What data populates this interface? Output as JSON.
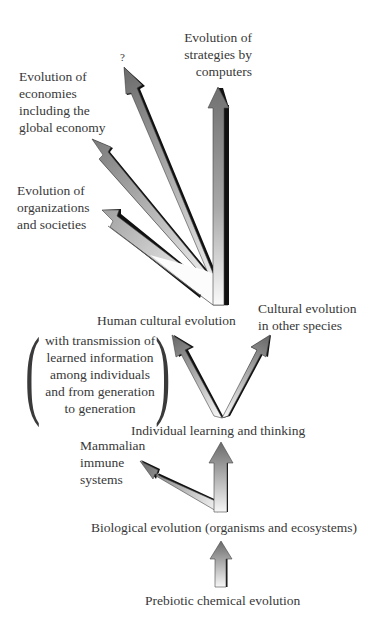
{
  "diagram": {
    "title": "",
    "nodes": {
      "computers": {
        "lines": [
          "Evolution of",
          "strategies by",
          "computers"
        ]
      },
      "unknown": {
        "lines": [
          "?"
        ]
      },
      "economies": {
        "lines": [
          "Evolution of",
          "economies",
          "including the",
          "global economy"
        ]
      },
      "organizations": {
        "lines": [
          "Evolution of",
          "organizations",
          "and societies"
        ]
      },
      "human_cultural": {
        "lines": [
          "Human cultural evolution"
        ]
      },
      "cultural_other": {
        "lines": [
          "Cultural evolution",
          "in other species"
        ]
      },
      "transmission_note": {
        "lines": [
          "with transmission of",
          "learned information",
          "among individuals",
          "and from generation",
          "to generation"
        ],
        "paren_open": "(",
        "paren_close": ")"
      },
      "individual_learning": {
        "lines": [
          "Individual learning and thinking"
        ]
      },
      "immune": {
        "lines": [
          "Mammalian",
          "immune",
          "systems"
        ]
      },
      "biological": {
        "lines": [
          "Biological evolution (organisms and ecosystems)"
        ]
      },
      "prebiotic": {
        "lines": [
          "Prebiotic chemical evolution"
        ]
      }
    },
    "edges": [
      {
        "from": "prebiotic",
        "to": "biological"
      },
      {
        "from": "biological",
        "to": "individual_learning"
      },
      {
        "from": "biological",
        "to": "immune"
      },
      {
        "from": "individual_learning",
        "to": "human_cultural"
      },
      {
        "from": "individual_learning",
        "to": "cultural_other"
      },
      {
        "from": "human_cultural",
        "to": "computers"
      },
      {
        "from": "human_cultural",
        "to": "unknown"
      },
      {
        "from": "human_cultural",
        "to": "economies"
      },
      {
        "from": "human_cultural",
        "to": "organizations"
      }
    ],
    "colors": {
      "background": "#ffffff",
      "text": "#383838",
      "arrow_dark": "#6e6e6e",
      "arrow_light": "#fafafa",
      "arrow_shadow": "#111111"
    }
  }
}
